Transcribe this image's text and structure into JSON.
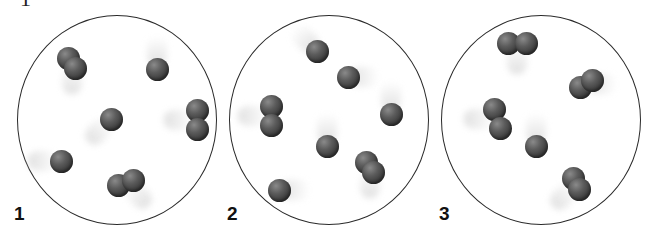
{
  "figure": {
    "top_crop_glyph": "1",
    "panels": [
      {
        "label": "1",
        "circle": {
          "x": 17,
          "y": 15,
          "w": 200,
          "h": 210
        },
        "species": [
          {
            "type": "diatomic",
            "atoms": [
              [
                68,
                58
              ],
              [
                75,
                68
              ]
            ],
            "trail_dir": "down"
          },
          {
            "type": "monatomic",
            "atoms": [
              [
                157,
                69
              ]
            ],
            "trail_dir": "up"
          },
          {
            "type": "diatomic",
            "atoms": [
              [
                197,
                110
              ],
              [
                197,
                129
              ]
            ],
            "trail_dir": "left"
          },
          {
            "type": "monatomic",
            "atoms": [
              [
                111,
                119
              ]
            ],
            "trail_dir": "down-left"
          },
          {
            "type": "monatomic",
            "atoms": [
              [
                61,
                161
              ]
            ],
            "trail_dir": "left"
          },
          {
            "type": "diatomic",
            "atoms": [
              [
                118,
                185
              ],
              [
                133,
                180
              ]
            ],
            "trail_dir": "down-right"
          }
        ]
      },
      {
        "label": "2",
        "circle": {
          "x": 229,
          "y": 15,
          "w": 200,
          "h": 210
        },
        "species": [
          {
            "type": "monatomic",
            "atoms": [
              [
                317,
                51
              ]
            ],
            "trail_dir": "up-left"
          },
          {
            "type": "monatomic",
            "atoms": [
              [
                348,
                77
              ]
            ],
            "trail_dir": "right"
          },
          {
            "type": "diatomic",
            "atoms": [
              [
                271,
                106
              ],
              [
                271,
                125
              ]
            ],
            "trail_dir": "left"
          },
          {
            "type": "monatomic",
            "atoms": [
              [
                391,
                114
              ]
            ],
            "trail_dir": "up"
          },
          {
            "type": "monatomic",
            "atoms": [
              [
                327,
                146
              ]
            ],
            "trail_dir": "up"
          },
          {
            "type": "diatomic",
            "atoms": [
              [
                366,
                162
              ],
              [
                373,
                172
              ]
            ],
            "trail_dir": "down"
          },
          {
            "type": "monatomic",
            "atoms": [
              [
                279,
                190
              ]
            ],
            "trail_dir": "right"
          }
        ]
      },
      {
        "label": "3",
        "circle": {
          "x": 441,
          "y": 15,
          "w": 200,
          "h": 210
        },
        "species": [
          {
            "type": "diatomic",
            "atoms": [
              [
                508,
                43
              ],
              [
                526,
                43
              ]
            ],
            "trail_dir": "down"
          },
          {
            "type": "diatomic",
            "atoms": [
              [
                580,
                87
              ],
              [
                592,
                80
              ]
            ],
            "trail_dir": "right"
          },
          {
            "type": "diatomic",
            "atoms": [
              [
                494,
                109
              ],
              [
                500,
                128
              ]
            ],
            "trail_dir": "left"
          },
          {
            "type": "monatomic",
            "atoms": [
              [
                536,
                146
              ]
            ],
            "trail_dir": "up"
          },
          {
            "type": "diatomic",
            "atoms": [
              [
                573,
                178
              ],
              [
                579,
                189
              ]
            ],
            "trail_dir": "down-left"
          }
        ]
      }
    ]
  }
}
